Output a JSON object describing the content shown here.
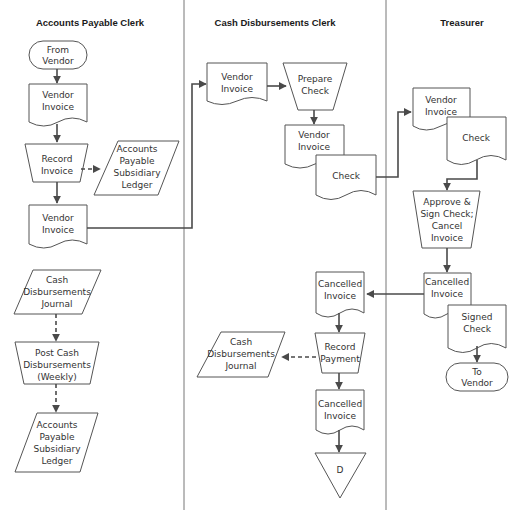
{
  "lanes": [
    {
      "title": "Accounts Payable Clerk"
    },
    {
      "title": "Cash Disbursements Clerk"
    },
    {
      "title": "Treasurer"
    }
  ],
  "ap": {
    "from_vendor": [
      "From",
      "Vendor"
    ],
    "vendor_invoice_1": [
      "Vendor",
      "Invoice"
    ],
    "record_invoice": [
      "Record",
      "Invoice"
    ],
    "ap_ledger_1": [
      "Accounts",
      "Payable",
      "Subsidiary",
      "Ledger"
    ],
    "vendor_invoice_2": [
      "Vendor",
      "Invoice"
    ],
    "cd_journal": [
      "Cash",
      "Disbursements",
      "Journal"
    ],
    "post_cd": [
      "Post Cash",
      "Disbursements",
      "(Weekly)"
    ],
    "ap_ledger_2": [
      "Accounts",
      "Payable",
      "Subsidiary",
      "Ledger"
    ]
  },
  "cd": {
    "vendor_invoice": [
      "Vendor",
      "Invoice"
    ],
    "prepare_check": [
      "Prepare",
      "Check"
    ],
    "vendor_invoice_2": [
      "Vendor",
      "Invoice"
    ],
    "check": [
      "Check"
    ],
    "cancelled_invoice_1": [
      "Cancelled",
      "Invoice"
    ],
    "record_payment": [
      "Record",
      "Payment"
    ],
    "cd_journal": [
      "Cash",
      "Disbursements",
      "Journal"
    ],
    "cancelled_invoice_2": [
      "Cancelled",
      "Invoice"
    ],
    "file_d": [
      "D"
    ]
  },
  "tr": {
    "vendor_invoice": [
      "Vendor",
      "Invoice"
    ],
    "check": [
      "Check"
    ],
    "approve": [
      "Approve &",
      "Sign Check;",
      "Cancel",
      "Invoice"
    ],
    "cancelled_invoice": [
      "Cancelled",
      "Invoice"
    ],
    "signed_check": [
      "Signed",
      "Check"
    ],
    "to_vendor": [
      "To",
      "Vendor"
    ]
  }
}
